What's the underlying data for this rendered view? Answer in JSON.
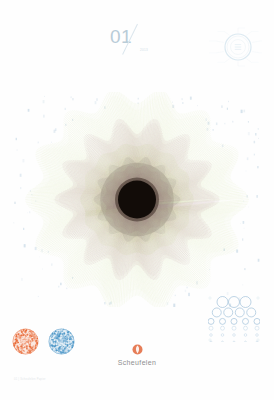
{
  "poster": {
    "background_color": "#fefefe"
  },
  "header": {
    "issue_number": "01",
    "issue_sub": "2013",
    "diagram_name": "process-wheel-diagram",
    "diagram_color": "#cfe2ec",
    "diagram_labels": [
      "paper",
      "pulp",
      "coating",
      "press",
      "finish",
      "quality",
      "ink",
      "sheet",
      "gloss",
      "matt"
    ],
    "diagram_center_text": "01"
  },
  "rosette": {
    "name": "guilloche-rosette",
    "lobes": 14,
    "layers": [
      {
        "name": "outer-ring",
        "color": "#c9d98a",
        "radius": 104,
        "opacity": 0.55
      },
      {
        "name": "mid-ring",
        "color": "#b08b8f",
        "radius": 74,
        "opacity": 0.55
      },
      {
        "name": "inner-disc",
        "color": "#8e8377",
        "radius": 40,
        "opacity": 0.8
      },
      {
        "name": "core",
        "color": "#120c08",
        "radius": 19,
        "opacity": 1
      }
    ],
    "speckle_color": "#c3d6e4"
  },
  "badges": [
    {
      "name": "award-badge-orange",
      "color": "#e8622c",
      "label": ""
    },
    {
      "name": "award-badge-blue",
      "color": "#3f8fc4",
      "label": ""
    }
  ],
  "brand": {
    "name": "Scheufelen",
    "mark_color": "#e2663a"
  },
  "dotgrid": {
    "name": "halftone-dot-grid",
    "color": "#a9c6dd",
    "rows": [
      {
        "count": 3,
        "size": 11
      },
      {
        "count": 4,
        "size": 9
      },
      {
        "count": 5,
        "size": 6
      },
      {
        "count": 5,
        "size": 4
      },
      {
        "count": 5,
        "size": 2.6
      },
      {
        "count": 5,
        "size": 1.6
      }
    ]
  },
  "footer": {
    "note": "01 | Scheufelen Papier"
  }
}
